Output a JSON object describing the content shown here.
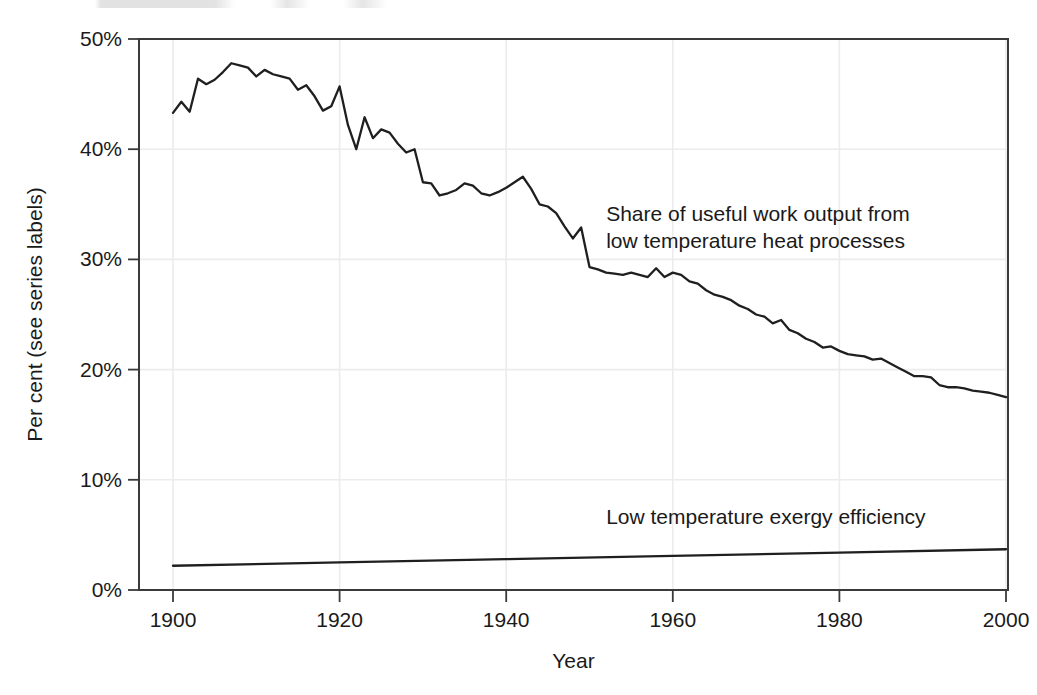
{
  "chart_data": {
    "type": "line",
    "title": "",
    "xlabel": "Year",
    "ylabel": "Per cent (see series labels)",
    "xlim": [
      1900,
      2000
    ],
    "ylim": [
      0,
      50
    ],
    "grid": true,
    "legend_position": "inline-annotations",
    "xticks": [
      "1900",
      "1920",
      "1940",
      "1960",
      "1980",
      "2000"
    ],
    "xtick_values": [
      1900,
      1920,
      1940,
      1960,
      1980,
      2000
    ],
    "yticks": [
      "0%",
      "10%",
      "20%",
      "30%",
      "40%",
      "50%"
    ],
    "ytick_values": [
      0,
      10,
      20,
      30,
      40,
      50
    ],
    "annotations": [
      {
        "name": "share-useful-work-label",
        "lines": [
          "Share of useful work output from",
          "low temperature heat processes"
        ],
        "x": 1952,
        "y": 33.5
      },
      {
        "name": "low-temp-exergy-label",
        "lines": [
          "Low temperature exergy efficiency"
        ],
        "x": 1952,
        "y": 6.0
      }
    ],
    "series": [
      {
        "name": "Share of useful work output from low temperature heat processes",
        "color": "#1f1f1f",
        "x": [
          1900,
          1901,
          1902,
          1903,
          1904,
          1905,
          1906,
          1907,
          1908,
          1909,
          1910,
          1911,
          1912,
          1913,
          1914,
          1915,
          1916,
          1917,
          1918,
          1919,
          1920,
          1921,
          1922,
          1923,
          1924,
          1925,
          1926,
          1927,
          1928,
          1929,
          1930,
          1931,
          1932,
          1933,
          1934,
          1935,
          1936,
          1937,
          1938,
          1939,
          1940,
          1941,
          1942,
          1943,
          1944,
          1945,
          1946,
          1947,
          1948,
          1949,
          1950,
          1951,
          1952,
          1953,
          1954,
          1955,
          1956,
          1957,
          1958,
          1959,
          1960,
          1961,
          1962,
          1963,
          1964,
          1965,
          1966,
          1967,
          1968,
          1969,
          1970,
          1971,
          1972,
          1973,
          1974,
          1975,
          1976,
          1977,
          1978,
          1979,
          1980,
          1981,
          1982,
          1983,
          1984,
          1985,
          1986,
          1987,
          1988,
          1989,
          1990,
          1991,
          1992,
          1993,
          1994,
          1995,
          1996,
          1997,
          1998,
          1999,
          2000
        ],
        "y": [
          43.3,
          44.3,
          43.4,
          46.4,
          45.9,
          46.3,
          47.0,
          47.8,
          47.6,
          47.4,
          46.6,
          47.2,
          46.8,
          46.6,
          46.4,
          45.4,
          45.8,
          44.8,
          43.5,
          43.9,
          45.7,
          42.2,
          40.0,
          42.9,
          41.0,
          41.8,
          41.5,
          40.5,
          39.7,
          40.0,
          37.0,
          36.9,
          35.8,
          36.0,
          36.3,
          36.9,
          36.7,
          36.0,
          35.8,
          36.1,
          36.5,
          37.0,
          37.5,
          36.4,
          35.0,
          34.8,
          34.2,
          33.0,
          31.9,
          32.9,
          29.3,
          29.1,
          28.8,
          28.7,
          28.6,
          28.8,
          28.6,
          28.4,
          29.2,
          28.4,
          28.8,
          28.6,
          28.0,
          27.8,
          27.2,
          26.8,
          26.6,
          26.3,
          25.8,
          25.5,
          25.0,
          24.8,
          24.2,
          24.5,
          23.6,
          23.3,
          22.8,
          22.5,
          22.0,
          22.1,
          21.7,
          21.4,
          21.3,
          21.2,
          20.9,
          21.0,
          20.6,
          20.2,
          19.8,
          19.4,
          19.4,
          19.3,
          18.6,
          18.4,
          18.4,
          18.3,
          18.1,
          18.0,
          17.9,
          17.7,
          17.5
        ]
      },
      {
        "name": "Low temperature exergy efficiency",
        "color": "#1f1f1f",
        "x": [
          1900,
          1920,
          1940,
          1960,
          1980,
          2000
        ],
        "y": [
          2.2,
          2.5,
          2.8,
          3.1,
          3.4,
          3.7
        ]
      }
    ]
  }
}
